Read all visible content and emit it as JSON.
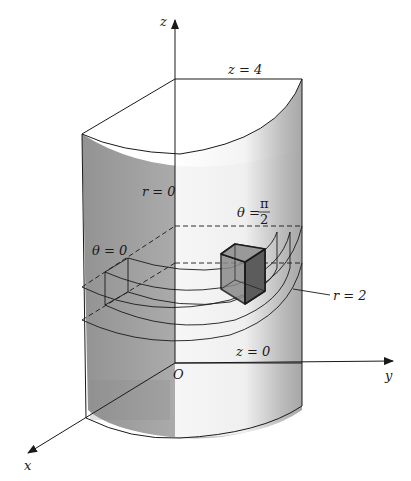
{
  "figure": {
    "type": "3D cylindrical coordinate region diagram",
    "axes": {
      "x_label": "x",
      "y_label": "y",
      "z_label": "z",
      "origin_label": "O"
    },
    "labels": {
      "top_plane": "z = 4",
      "bottom_plane": "z = 0",
      "inner_radius": "r = 0",
      "outer_radius": "r = 2",
      "theta_start": "θ = 0",
      "theta_end_prefix": "θ = ",
      "theta_end_num": "π",
      "theta_end_den": "2"
    },
    "colors": {
      "line": "#1a1a1a",
      "surface_shade": "#9a9a9a",
      "cube_fill": "#7a7a7a",
      "cube_side": "#555555",
      "background": "#ffffff"
    }
  }
}
